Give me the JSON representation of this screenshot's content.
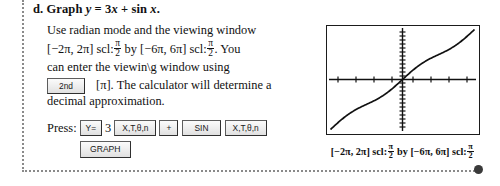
{
  "problem": {
    "label": "d.",
    "title_prefix": "Graph",
    "title_expr_y": "y",
    "title_eq": "= 3",
    "title_var_x1": "x",
    "title_plus": "+ sin",
    "title_var_x2": "x",
    "title_period": "."
  },
  "body": {
    "line1": "Use radian mode and the viewing window",
    "line2_a": "[−2π, 2π] scl:",
    "line2_b": "by [−6π, 6π] scl:",
    "line2_c": ". You",
    "line3": "can enter the viewin\\g window using",
    "line4_after_key": "[π]. The calculator will determine a",
    "line5": "decimal approximation.",
    "frac_numerator": "π",
    "frac_denominator": "2"
  },
  "keys": {
    "second": "2nd",
    "press_label": "Press:",
    "y_equals": "Y=",
    "number_three": "3",
    "x_t_theta_n": "X,T,θ,n",
    "plus": "+",
    "sin": "SIN",
    "x_t_theta_n_2": "X,T,θ,n",
    "graph": "GRAPH"
  },
  "caption": {
    "x_interval": "[−2π, 2π] scl:",
    "by": "by",
    "y_interval": "[−6π, 6π] scl:",
    "frac_numerator": "π",
    "frac_denominator": "2"
  },
  "chart_data": {
    "type": "line",
    "title": "",
    "xlabel": "",
    "ylabel": "",
    "function": "y = 3x + sin x",
    "xlim": [
      -6.283185,
      6.283185
    ],
    "ylim": [
      -18.849556,
      18.849556
    ],
    "x_scale": 1.570796,
    "y_scale": 1.570796,
    "grid": false,
    "legend": "none",
    "axes_visible": true,
    "x_tick_count": 8,
    "y_tick_count": 24,
    "x": [
      -6.283185,
      -5.759587,
      -5.235988,
      -4.712389,
      -4.18879,
      -3.665191,
      -3.141593,
      -2.617994,
      -2.094395,
      -1.570796,
      -1.047198,
      -0.523599,
      0,
      0.523599,
      1.047198,
      1.570796,
      2.094395,
      2.617994,
      3.141593,
      3.665191,
      4.18879,
      4.712389,
      5.235988,
      5.759587,
      6.283185
    ],
    "y": [
      -18.849556,
      -17.778761,
      -16.574,
      -15.137167,
      -13.432367,
      -11.495574,
      -9.424778,
      -7.354,
      -5.417,
      -3.712389,
      -2.275,
      -1.070761,
      0,
      1.070761,
      2.275,
      3.712389,
      5.417,
      7.354,
      9.424778,
      11.495574,
      13.432367,
      15.137167,
      16.574,
      17.778761,
      18.849556
    ]
  }
}
